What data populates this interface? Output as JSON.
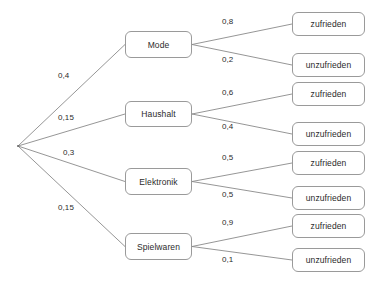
{
  "diagram": {
    "type": "probability-tree",
    "line_color": "#8a8a8a",
    "box_border_color": "#9a9a9a",
    "text_color": "#2b2b2b",
    "background": "#ffffff"
  },
  "root": {
    "label": "",
    "x": 18,
    "y": 146
  },
  "level1": [
    {
      "id": "mode",
      "label": "Mode",
      "probability": "0,4",
      "prob_label_x": 58,
      "prob_label_y": 71,
      "box": {
        "x": 125,
        "y": 31,
        "w": 67,
        "h": 27
      }
    },
    {
      "id": "haushalt",
      "label": "Haushalt",
      "probability": "0,15",
      "prob_label_x": 58,
      "prob_label_y": 113,
      "box": {
        "x": 125,
        "y": 101,
        "w": 67,
        "h": 26
      }
    },
    {
      "id": "elektronik",
      "label": "Elektronik",
      "probability": "0,3",
      "prob_label_x": 63,
      "prob_label_y": 148,
      "box": {
        "x": 125,
        "y": 168,
        "w": 67,
        "h": 27
      }
    },
    {
      "id": "spielwaren",
      "label": "Spielwaren",
      "probability": "0,15",
      "prob_label_x": 58,
      "prob_label_y": 203,
      "box": {
        "x": 125,
        "y": 233,
        "w": 67,
        "h": 27
      }
    }
  ],
  "level2": [
    {
      "id": "mode-zufrieden",
      "parent": "mode",
      "label": "zufrieden",
      "probability": "0,8",
      "prob_label_x": 222,
      "prob_label_y": 17,
      "box": {
        "x": 292,
        "y": 12,
        "w": 73,
        "h": 24
      }
    },
    {
      "id": "mode-unzufrieden",
      "parent": "mode",
      "label": "unzufrieden",
      "probability": "0,2",
      "prob_label_x": 222,
      "prob_label_y": 55,
      "box": {
        "x": 292,
        "y": 53,
        "w": 73,
        "h": 24
      }
    },
    {
      "id": "haushalt-zufrieden",
      "parent": "haushalt",
      "label": "zufrieden",
      "probability": "0,6",
      "prob_label_x": 222,
      "prob_label_y": 88,
      "box": {
        "x": 292,
        "y": 82,
        "w": 73,
        "h": 24
      }
    },
    {
      "id": "haushalt-unzufrieden",
      "parent": "haushalt",
      "label": "unzufrieden",
      "probability": "0,4",
      "prob_label_x": 222,
      "prob_label_y": 122,
      "box": {
        "x": 292,
        "y": 122,
        "w": 73,
        "h": 24
      }
    },
    {
      "id": "elektronik-zufrieden",
      "parent": "elektronik",
      "label": "zufrieden",
      "probability": "0,5",
      "prob_label_x": 222,
      "prob_label_y": 153,
      "box": {
        "x": 292,
        "y": 151,
        "w": 73,
        "h": 24
      }
    },
    {
      "id": "elektronik-unzufrieden",
      "parent": "elektronik",
      "label": "unzufrieden",
      "probability": "0,5",
      "prob_label_x": 222,
      "prob_label_y": 190,
      "box": {
        "x": 292,
        "y": 186,
        "w": 73,
        "h": 24
      }
    },
    {
      "id": "spielwaren-zufrieden",
      "parent": "spielwaren",
      "label": "zufrieden",
      "probability": "0,9",
      "prob_label_x": 222,
      "prob_label_y": 218,
      "box": {
        "x": 292,
        "y": 214,
        "w": 73,
        "h": 24
      }
    },
    {
      "id": "spielwaren-unzufrieden",
      "parent": "spielwaren",
      "label": "unzufrieden",
      "probability": "0,1",
      "prob_label_x": 222,
      "prob_label_y": 255,
      "box": {
        "x": 292,
        "y": 248,
        "w": 73,
        "h": 24
      }
    }
  ]
}
